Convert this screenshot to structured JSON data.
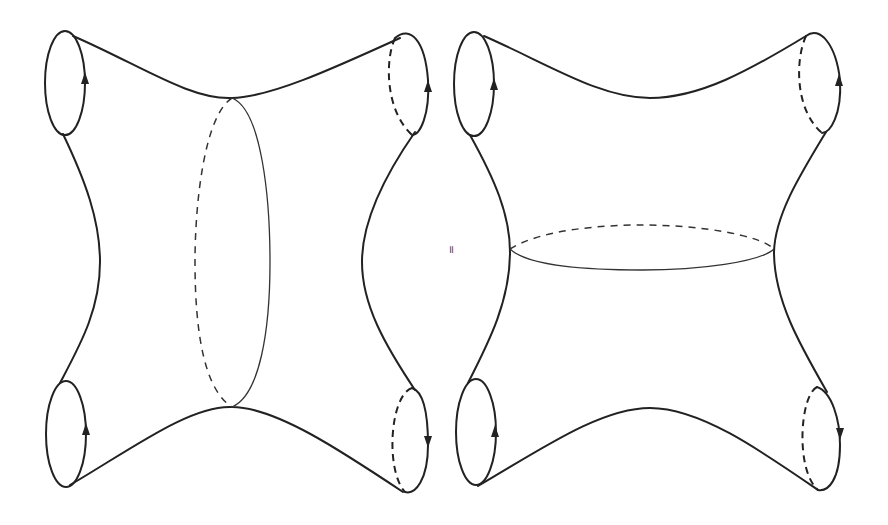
{
  "figure": {
    "relation_symbol": "=",
    "left_surface": {
      "name": "s-channel decomposition",
      "cut": "vertical cut circle through middle"
    },
    "right_surface": {
      "name": "t-channel decomposition",
      "cut": "horizontal cut circle through waist"
    },
    "boundary_circles": 4,
    "stroke_color": "#222222",
    "background": "#ffffff"
  }
}
